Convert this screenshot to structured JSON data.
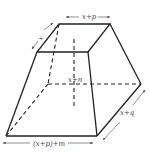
{
  "diagram": {
    "type": "frustum-rectangular-pyramid",
    "labels": {
      "top_width": "x+p",
      "top_depth": "x",
      "height": "x+n",
      "bottom_depth": "x+q",
      "bottom_width": "(x+p)+m"
    },
    "colors": {
      "edge": "#222222",
      "label": "#444444",
      "background": "#ffffff"
    }
  }
}
